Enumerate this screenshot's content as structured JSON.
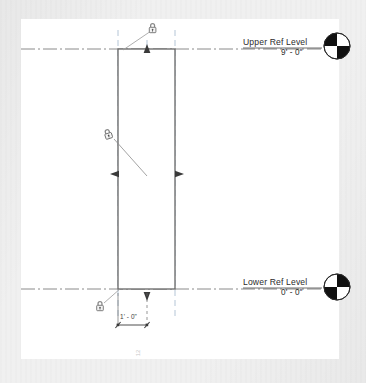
{
  "view": {
    "type": "elevation-view",
    "background_color": "#f0f0f0",
    "canvas_color": "#ffffff"
  },
  "levels": [
    {
      "id": "upper",
      "name": "Upper Ref Level",
      "elevation": "9' - 0\"",
      "y": 49,
      "head_black_quadrants": "upper-left,lower-right"
    },
    {
      "id": "lower",
      "name": "Lower Ref Level",
      "elevation": "0' - 0\"",
      "y": 289,
      "head_black_quadrants": "upper-right,lower-left"
    }
  ],
  "dimension": {
    "label": "1' - 0\"",
    "value_feet": 1,
    "value_inches": 0
  },
  "extrusion": {
    "left": 118,
    "right": 175,
    "top": 49,
    "bottom": 289,
    "stroke_color": "#666666",
    "fill_color": "#ffffff"
  },
  "constraints": [
    {
      "id": "top-lock",
      "icon": "padlock-icon",
      "state": "locked",
      "x": 152,
      "y": 26
    },
    {
      "id": "bottom-lock",
      "icon": "padlock-icon",
      "state": "locked",
      "x": 100,
      "y": 305
    },
    {
      "id": "center-lock",
      "icon": "padlock-icon",
      "state": "locked",
      "x": 108,
      "y": 134
    }
  ],
  "grips": [
    {
      "id": "top-arrow-grip",
      "direction": "up",
      "x": 147,
      "y": 52
    },
    {
      "id": "bottom-arrow-grip",
      "direction": "down",
      "x": 147,
      "y": 293
    },
    {
      "id": "left-arrow-grip",
      "direction": "left",
      "x": 116,
      "y": 174
    },
    {
      "id": "right-arrow-grip",
      "direction": "right",
      "x": 177,
      "y": 174
    }
  ],
  "rotated_label": {
    "text": "12",
    "color": "#c9c9c9"
  },
  "colors": {
    "reference_plane": "#7f9fbf",
    "level_line": "#6d6d6d",
    "geometry_stroke": "#666666",
    "dimension_line": "#4a4a4a",
    "text": "#2b2b2b"
  }
}
